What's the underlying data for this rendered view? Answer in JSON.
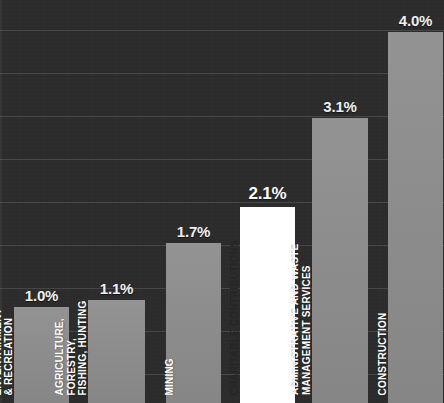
{
  "chart_data": {
    "type": "bar",
    "title": "",
    "subtitle": "",
    "xlabel": "",
    "ylabel": "",
    "ylim": [
      0,
      4.6
    ],
    "grid": true,
    "grid_axis": "y",
    "legend": false,
    "value_suffix": "%",
    "highlight_category": "CHARITABLE CONTRIBUTIONS",
    "categories": [
      "ARTS, ENTERTAINMENT & RECREATION",
      "AGRICULTURE, FORESTRY, FISHING, HUNTING",
      "MINING",
      "CHARITABLE CONTRIBUTIONS",
      "ADMINISTRATIVE AND WASTE MANAGEMENT SERVICES",
      "CONSTRUCTION"
    ],
    "values": [
      1.0,
      1.1,
      1.7,
      2.1,
      3.1,
      4.0
    ],
    "value_labels": [
      "1.0%",
      "1.1%",
      "1.7%",
      "2.1%",
      "3.1%",
      "4.0%"
    ]
  },
  "colors": {
    "background": "#2b2b2b",
    "bar": "#8d8d8d",
    "bar_highlight": "#ffffff",
    "gridline": "#474747",
    "value_text": "#efefef",
    "label_text_light": "#ffffff",
    "label_text_dark": "#262626"
  },
  "bars": [
    {
      "id": "arts-entertainment-recreation",
      "value_label": "1.0%",
      "value": 1.0,
      "highlight": false,
      "label_lines": [
        "ARTS,",
        "ENTERTAINMENT",
        "& RECREATION"
      ]
    },
    {
      "id": "agriculture-forestry-fishing-hunting",
      "value_label": "1.1%",
      "value": 1.1,
      "highlight": false,
      "label_lines": [
        "AGRICULTURE,",
        "FORESTRY,",
        "FISHING, HUNTING"
      ]
    },
    {
      "id": "mining",
      "value_label": "1.7%",
      "value": 1.7,
      "highlight": false,
      "label_lines": [
        "MINING"
      ]
    },
    {
      "id": "charitable-contributions",
      "value_label": "2.1%",
      "value": 2.1,
      "highlight": true,
      "label_lines": [
        "CHARITABLE CONTRIBUTIONS"
      ]
    },
    {
      "id": "administrative-waste-management-services",
      "value_label": "3.1%",
      "value": 3.1,
      "highlight": false,
      "label_lines": [
        "ADMINISTRATIVE AND WASTE",
        "MANAGEMENT SERVICES"
      ]
    },
    {
      "id": "construction",
      "value_label": "4.0%",
      "value": 4.0,
      "highlight": false,
      "label_lines": [
        "CONSTRUCTION"
      ]
    }
  ],
  "layout": {
    "width": 444,
    "height": 403,
    "gridline_y_positions": [
      30,
      73,
      116,
      159,
      202,
      245,
      288,
      331,
      374
    ],
    "bar_x_positions": [
      14,
      88,
      166,
      240,
      312,
      388
    ],
    "bar_widths": [
      55,
      57,
      55,
      55,
      56,
      55
    ],
    "bar_top_positions": [
      307,
      300,
      243,
      207,
      118,
      32
    ]
  }
}
